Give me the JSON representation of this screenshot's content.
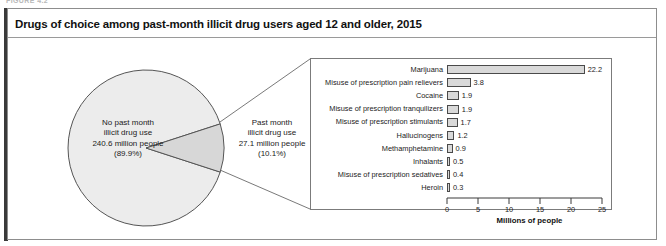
{
  "figure_caption": "FIGURE 4.2",
  "title": "Drugs of choice among past-month illicit drug users aged 12 and older, 2015",
  "pie": {
    "no_use": {
      "line1": "No past month",
      "line2": "illicit drug use",
      "line3": "240.6 million people",
      "line4": "(89.9%)"
    },
    "past_month": {
      "line1": "Past month",
      "line2": "illicit drug use",
      "line3": "27.1 million people",
      "line4": "(10.1%)"
    }
  },
  "chart_data": {
    "type": "bar",
    "orientation": "horizontal",
    "title": "Drugs of choice among past-month illicit drug users aged 12 and older, 2015",
    "xlabel": "Millions of people",
    "ylabel": "",
    "xlim": [
      0,
      25
    ],
    "xticks": [
      0,
      5,
      10,
      15,
      20,
      25
    ],
    "grid": false,
    "legend": false,
    "categories": [
      "Marijuana",
      "Misuse of prescription pain relievers",
      "Cocaine",
      "Misuse of prescription tranquilizers",
      "Misuse of prescription stimulants",
      "Hallucinogens",
      "Methamphetamine",
      "Inhalants",
      "Misuse of prescription sedatives",
      "Heroin"
    ],
    "values": [
      22.2,
      3.8,
      1.9,
      1.9,
      1.7,
      1.2,
      0.9,
      0.5,
      0.4,
      0.3
    ],
    "value_labels": [
      "22.2",
      "3.8",
      "1.9",
      "1.9",
      "1.7",
      "1.2",
      "0.9",
      "0.5",
      "0.4",
      "0.3"
    ],
    "pie": {
      "type": "pie",
      "categories": [
        "No past month illicit drug use",
        "Past month illicit drug use"
      ],
      "values": [
        240.6,
        27.1
      ],
      "percent": [
        89.9,
        10.1
      ]
    }
  },
  "colors": {
    "bar_fill": "#d9d9d9",
    "bar_stroke": "#4a4a4a",
    "pie_fill_major": "#ebebeb",
    "pie_fill_minor": "#d9d9d9",
    "frame": "#8d8d8d",
    "accent": "#3a3a3a",
    "text": "#1b1b1b"
  }
}
